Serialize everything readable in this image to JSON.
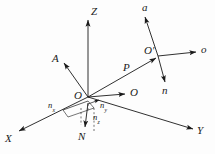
{
  "figure": {
    "background_color": "#fdfdfd",
    "stroke_color": "#1a1a1a",
    "labels": {
      "axis_z": "Z",
      "axis_x": "X",
      "axis_y": "Y",
      "origin_o": "O",
      "world_a": "A",
      "world_o_vector": "O",
      "vector_p": "P",
      "tool_origin": "O′",
      "tool_a": "a",
      "tool_o": "o",
      "tool_n": "n",
      "normal_n": "N",
      "n_x_base": "n",
      "n_x_sub": "x",
      "n_y_base": "n",
      "n_y_sub": "y",
      "n_z_base": "n",
      "n_z_sub": "z"
    }
  },
  "geometry": {
    "origin": {
      "x": 88,
      "y": 97
    },
    "tool_origin": {
      "x": 158,
      "y": 56
    },
    "axis_z_tip": {
      "x": 88,
      "y": 18
    },
    "axis_x_tip": {
      "x": 16,
      "y": 133
    },
    "axis_y_tip": {
      "x": 196,
      "y": 131
    },
    "world_a_tip": {
      "x": 62,
      "y": 60
    },
    "world_o_tip": {
      "x": 128,
      "y": 94
    },
    "tool_a_tip": {
      "x": 143,
      "y": 13
    },
    "tool_o_tip": {
      "x": 199,
      "y": 52
    },
    "tool_n_tip": {
      "x": 166,
      "y": 85
    },
    "normal_n_tip": {
      "x": 84,
      "y": 130
    }
  }
}
